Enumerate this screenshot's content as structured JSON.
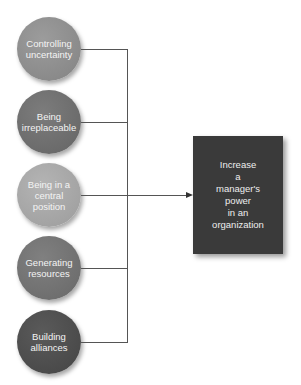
{
  "diagram": {
    "sources": [
      {
        "label": "Controlling uncertainty",
        "color": "#8e8e8e"
      },
      {
        "label": "Being irreplaceable",
        "color": "#6e6e6e"
      },
      {
        "label": "Being in a central position",
        "color": "#a8a8a8"
      },
      {
        "label": "Generating resources",
        "color": "#727272"
      },
      {
        "label": "Building alliances",
        "color": "#4e4e4e"
      }
    ],
    "target": {
      "label": "Increase\na\nmanager's\npower\nin an\norganization",
      "color": "#3a3a3a"
    },
    "connector_color": "#555555"
  }
}
